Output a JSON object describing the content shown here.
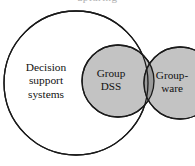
{
  "figure": {
    "type": "venn-diagram",
    "width": 195,
    "height": 166,
    "background_color": "#ffffff",
    "stroke_color": "#1a1a1a",
    "fill_light_gray": "#c3c3c3",
    "fill_overlap_gray": "#9a9a9a",
    "text_color": "#111111",
    "clipped_caption_fragment": "apturing"
  },
  "sets": {
    "outer": {
      "id": "decision-support-systems",
      "label_lines": [
        "Decision",
        "support",
        "systems"
      ],
      "fill": "none",
      "cx": 76,
      "cy": 83,
      "r": 72,
      "label_x": 46,
      "label_y": 81
    },
    "middle": {
      "id": "group-dss",
      "label_lines": [
        "Group",
        "DSS"
      ],
      "fill": "#c3c3c3",
      "cx": 118,
      "cy": 81,
      "r": 36,
      "label_x": 111,
      "label_y": 80
    },
    "right": {
      "id": "groupware",
      "label_lines": [
        "Group-",
        "ware"
      ],
      "fill": "#c3c3c3",
      "cx": 180,
      "cy": 83,
      "r": 36,
      "label_x": 172,
      "label_y": 82
    }
  },
  "overlap": {
    "id": "group-dss-groupware-intersection",
    "fill": "#9a9a9a"
  }
}
